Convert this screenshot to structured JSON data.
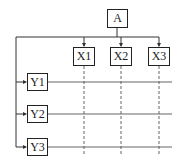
{
  "diagram": {
    "root": {
      "label": "A"
    },
    "columns": [
      {
        "label": "X1"
      },
      {
        "label": "X2"
      },
      {
        "label": "X3"
      }
    ],
    "rows": [
      {
        "label": "Y1"
      },
      {
        "label": "Y2"
      },
      {
        "label": "Y3"
      }
    ]
  },
  "colors": {
    "line": "#222222",
    "grid_line": "#666666",
    "background": "#ffffff"
  }
}
